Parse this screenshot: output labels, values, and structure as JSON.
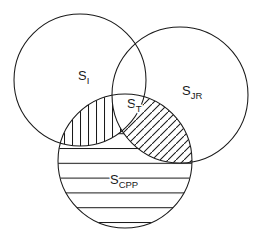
{
  "figure": {
    "type": "venn-diagram",
    "set_count": 3,
    "background_color": "#ffffff",
    "stroke_color": "#1a1a1a"
  },
  "sets": [
    {
      "id": "s-i",
      "name": "set-i",
      "base": "S",
      "subscript": "I",
      "label_x": 78,
      "label_y": 80,
      "cx": 80,
      "cy": 80,
      "r": 66
    },
    {
      "id": "s-jr",
      "name": "set-jr",
      "base": "S",
      "subscript": "JR",
      "label_x": 182,
      "label_y": 95,
      "cx": 180,
      "cy": 95,
      "r": 68
    },
    {
      "id": "s-cpp",
      "name": "set-cpp",
      "base": "S",
      "subscript": "CPP",
      "label_x": 110,
      "label_y": 184,
      "cx": 125,
      "cy": 161,
      "r": 67
    }
  ],
  "regions": [
    {
      "id": "region-t",
      "name": "set-t-intersection",
      "base": "S",
      "subscript": "T",
      "label_x": 127,
      "label_y": 108,
      "pattern": "none",
      "description": "triple intersection"
    },
    {
      "id": "region-i-cpp",
      "name": "intersection-i-cpp",
      "pattern": "vertical-hatch",
      "hatch_spacing": 8,
      "description": "S_I intersect S_CPP"
    },
    {
      "id": "region-jr-cpp",
      "name": "intersection-jr-cpp",
      "pattern": "diagonal-hatch",
      "hatch_spacing": 8,
      "hatch_angle_deg": 45,
      "description": "S_JR intersect S_CPP"
    },
    {
      "id": "region-cpp-only",
      "name": "cpp-exclusive",
      "pattern": "horizontal-hatch",
      "hatch_spacing": 15,
      "description": "S_CPP outside the other sets"
    }
  ]
}
